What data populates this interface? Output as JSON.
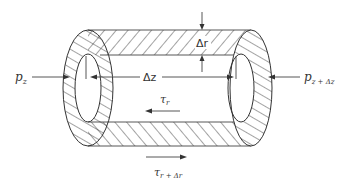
{
  "labels": {
    "pressure_left": "p",
    "pressure_left_sub": "z",
    "pressure_right": "p",
    "pressure_right_sub": "z + Δz",
    "delta_z": "Δz",
    "delta_r": "Δr",
    "shear_inner": "τ",
    "shear_inner_sub": "r",
    "shear_outer": "τ",
    "shear_outer_sub": "r + Δr"
  },
  "colors": {
    "ink": "#333333",
    "background": "#ffffff"
  }
}
